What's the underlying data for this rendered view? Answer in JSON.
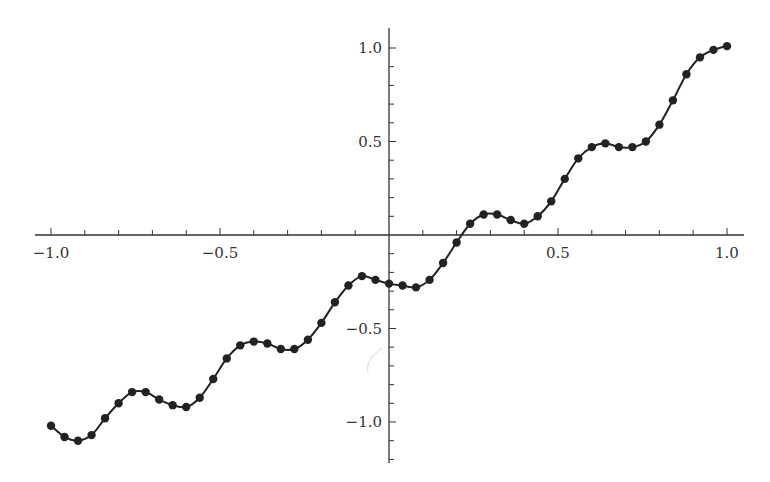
{
  "chart_data": {
    "type": "line",
    "title": "",
    "xlabel": "",
    "ylabel": "",
    "xlim": [
      -1.0,
      1.0
    ],
    "ylim": [
      -1.15,
      1.1
    ],
    "grid": false,
    "legend": null,
    "markers": true,
    "x_ticks": [
      -1.0,
      -0.5,
      0.5,
      1.0
    ],
    "x_tick_labels": [
      "−1.0",
      "−0.5",
      "0.5",
      "1.0"
    ],
    "y_ticks": [
      1.0,
      0.5,
      -0.5,
      -1.0
    ],
    "y_tick_labels": [
      "1.0",
      "0.5",
      "−0.5",
      "−1.0"
    ],
    "minor_tick_step": 0.1,
    "x": [
      -1.0,
      -0.96,
      -0.92,
      -0.88,
      -0.84,
      -0.8,
      -0.76,
      -0.72,
      -0.68,
      -0.64,
      -0.6,
      -0.56,
      -0.52,
      -0.48,
      -0.44,
      -0.4,
      -0.36,
      -0.32,
      -0.28,
      -0.24,
      -0.2,
      -0.16,
      -0.12,
      -0.08,
      -0.04,
      0.0,
      0.04,
      0.08,
      0.12,
      0.16,
      0.2,
      0.24,
      0.28,
      0.32,
      0.36,
      0.4,
      0.44,
      0.48,
      0.52,
      0.56,
      0.6,
      0.64,
      0.68,
      0.72,
      0.76,
      0.8,
      0.84,
      0.88,
      0.92,
      0.96,
      1.0
    ],
    "series": [
      {
        "name": "data",
        "color": "#222222",
        "values": [
          -1.02,
          -1.08,
          -1.1,
          -1.07,
          -0.98,
          -0.9,
          -0.84,
          -0.84,
          -0.88,
          -0.91,
          -0.92,
          -0.87,
          -0.77,
          -0.66,
          -0.59,
          -0.57,
          -0.58,
          -0.61,
          -0.61,
          -0.56,
          -0.47,
          -0.36,
          -0.27,
          -0.22,
          -0.24,
          -0.26,
          -0.27,
          -0.28,
          -0.24,
          -0.15,
          -0.04,
          0.06,
          0.11,
          0.11,
          0.08,
          0.06,
          0.1,
          0.18,
          0.3,
          0.41,
          0.47,
          0.49,
          0.47,
          0.47,
          0.5,
          0.59,
          0.72,
          0.86,
          0.95,
          0.99,
          1.01
        ]
      }
    ]
  }
}
